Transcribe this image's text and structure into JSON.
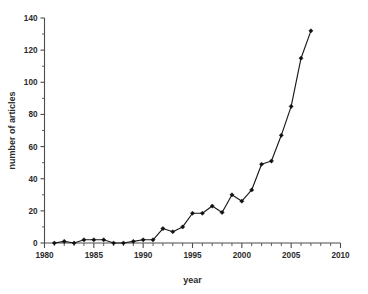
{
  "chart_data": {
    "type": "line",
    "title": "",
    "subtitle": "",
    "xlabel": "year",
    "ylabel": "number of articles",
    "xlim": [
      1980,
      2010
    ],
    "ylim": [
      0,
      140
    ],
    "grid": false,
    "legend": "none",
    "x_tick_labels": [
      "1980",
      "1985",
      "1990",
      "1995",
      "2000",
      "2005",
      "2010"
    ],
    "x_tick_values": [
      1980,
      1985,
      1990,
      1995,
      2000,
      2005,
      2010
    ],
    "x_minor_tick_step": 1,
    "y_tick_labels": [
      "0",
      "20",
      "40",
      "60",
      "80",
      "100",
      "120",
      "140"
    ],
    "y_tick_values": [
      0,
      20,
      40,
      60,
      80,
      100,
      120,
      140
    ],
    "series": [
      {
        "name": "number of articles",
        "color": "#111111",
        "marker": "filled-diamond",
        "x": [
          1981,
          1982,
          1983,
          1984,
          1985,
          1986,
          1987,
          1988,
          1989,
          1990,
          1991,
          1992,
          1993,
          1994,
          1995,
          1996,
          1997,
          1998,
          1999,
          2000,
          2001,
          2002,
          2003,
          2004,
          2005,
          2006,
          2007
        ],
        "values": [
          0,
          1,
          0,
          2,
          2,
          2,
          0,
          0,
          1,
          2,
          2,
          9,
          7,
          10,
          18.5,
          18.5,
          23,
          19,
          30,
          26,
          33,
          49,
          51,
          67,
          85,
          115,
          132
        ]
      }
    ]
  }
}
